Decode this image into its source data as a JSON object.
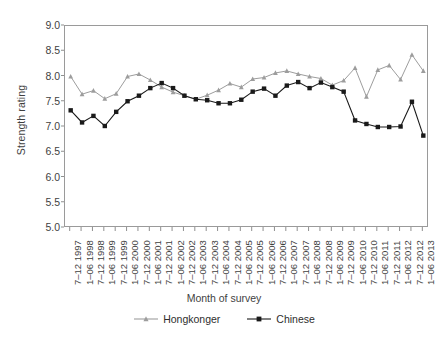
{
  "chart_data": {
    "type": "line",
    "title": "",
    "xlabel": "Month of survey",
    "ylabel": "Strength rating",
    "ylim": [
      5.0,
      9.0
    ],
    "ystep": 0.5,
    "grid": false,
    "legend_position": "bottom",
    "ytick_labels": [
      "9.0",
      "8.5",
      "8.0",
      "7.5",
      "7.0",
      "6.5",
      "6.0",
      "5.5",
      "5.0"
    ],
    "categories": [
      "7–12 1997",
      "1–06 1998",
      "7–12 1998",
      "1–06 1999",
      "7–12 1999",
      "1–06 2000",
      "7–12 2000",
      "1–06 2001",
      "7–12 2001",
      "1–06 2002",
      "7–12 2002",
      "1–06 2003",
      "7–12 2003",
      "1–06 2004",
      "7–12 2004",
      "1–06 2005",
      "7–12 2005",
      "1–06 2006",
      "7–12 2006",
      "1–06 2007",
      "7–12 2007",
      "1–06 2008",
      "7–12 2008",
      "1–06 2009",
      "7–12 2009",
      "1–06 2010",
      "7–12 2010",
      "1–06 2011",
      "7–12 2011",
      "1–06 2012",
      "7–12 2012",
      "1–06 2013"
    ],
    "series": [
      {
        "name": "Hongkonger",
        "marker": "triangle",
        "color": "#9d9d9d",
        "values": [
          8.0,
          7.65,
          7.72,
          7.56,
          7.66,
          8.0,
          8.05,
          7.93,
          7.79,
          7.69,
          7.62,
          7.55,
          7.63,
          7.73,
          7.86,
          7.79,
          7.95,
          7.98,
          8.07,
          8.11,
          8.05,
          8.0,
          7.96,
          7.83,
          7.92,
          8.17,
          7.6,
          8.13,
          8.22,
          7.94,
          8.43,
          8.11
        ]
      },
      {
        "name": "Chinese",
        "marker": "square",
        "color": "#1a1a1a",
        "values": [
          7.33,
          7.09,
          7.22,
          7.02,
          7.3,
          7.51,
          7.62,
          7.77,
          7.87,
          7.77,
          7.62,
          7.55,
          7.53,
          7.47,
          7.47,
          7.54,
          7.7,
          7.76,
          7.62,
          7.82,
          7.89,
          7.77,
          7.88,
          7.79,
          7.7,
          7.13,
          7.06,
          7.0,
          7.0,
          7.01,
          7.5,
          6.83
        ]
      }
    ]
  },
  "legend": {
    "items": [
      {
        "label": "Hongkonger"
      },
      {
        "label": "Chinese"
      }
    ]
  }
}
